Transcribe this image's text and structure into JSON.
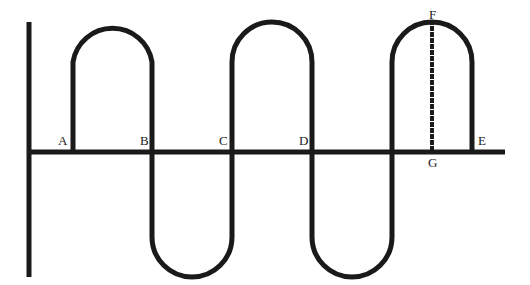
{
  "figure": {
    "width": 530,
    "height": 285,
    "background_color": "#ffffff",
    "ink_color": "#1a1a1a"
  },
  "axes": {
    "vertical": {
      "name": "y-axis",
      "x": 29,
      "y_top": 22,
      "y_bottom": 277,
      "stroke_width": 5
    },
    "horizontal": {
      "name": "x-axis",
      "y": 152,
      "x_left": 29,
      "x_right": 505,
      "stroke_width": 5
    }
  },
  "curve": {
    "stroke_width": 5,
    "lobe_radius": 40,
    "crest_y": 22,
    "trough_y": 277,
    "baseline_y": 152,
    "segments": [
      {
        "kind": "crest",
        "x_start": 73,
        "x_end": 152,
        "extreme_y": 22
      },
      {
        "kind": "trough",
        "x_start": 152,
        "x_end": 232,
        "extreme_y": 277
      },
      {
        "kind": "crest",
        "x_start": 232,
        "x_end": 312,
        "extreme_y": 22
      },
      {
        "kind": "trough",
        "x_start": 312,
        "x_end": 392,
        "extreme_y": 277
      },
      {
        "kind": "crest",
        "x_start": 392,
        "x_end": 472,
        "extreme_y": 22
      }
    ],
    "path": "M 73 152 L 73 62 A 40 40 0 0 1 152 62 L 152 237 A 40 40 0 0 0 232 237 L 232 62 A 40 40 0 0 1 312 62 L 312 237 A 40 40 0 0 0 392 237 L 392 62 A 40 40 0 0 1 472 62 L 472 152"
  },
  "dashed_segment": {
    "name": "FG",
    "x": 432,
    "y_top": 22,
    "y_bottom": 152,
    "stroke_width": 4,
    "dash_pattern": "1 5",
    "line_cap": "square"
  },
  "labels": [
    {
      "id": "A",
      "text": "A",
      "x": 58,
      "y": 134,
      "anchor": "left"
    },
    {
      "id": "B",
      "text": "B",
      "x": 140,
      "y": 134,
      "anchor": "left"
    },
    {
      "id": "C",
      "text": "C",
      "x": 219,
      "y": 134,
      "anchor": "left"
    },
    {
      "id": "D",
      "text": "D",
      "x": 299,
      "y": 134,
      "anchor": "left"
    },
    {
      "id": "E",
      "text": "E",
      "x": 478,
      "y": 134,
      "anchor": "left"
    },
    {
      "id": "F",
      "text": "F",
      "x": 429,
      "y": 8,
      "anchor": "left"
    },
    {
      "id": "G",
      "text": "G",
      "x": 428,
      "y": 156,
      "anchor": "left"
    }
  ]
}
